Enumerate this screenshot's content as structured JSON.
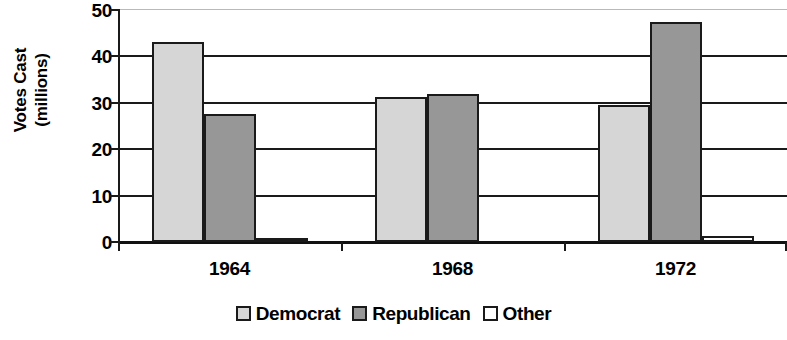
{
  "chart_data": {
    "type": "bar",
    "title": "",
    "xlabel": "",
    "ylabel": "Votes Cast (millions)",
    "ylabel_lines": [
      "Votes Cast",
      "(millions)"
    ],
    "categories": [
      "1964",
      "1968",
      "1972"
    ],
    "series": [
      {
        "name": "Democrat",
        "color": "#d6d6d6",
        "values": [
          43.1,
          31.3,
          29.5
        ]
      },
      {
        "name": "Republican",
        "color": "#979797",
        "values": [
          27.5,
          31.8,
          47.4
        ]
      },
      {
        "name": "Other",
        "color": "#ffffff",
        "values": [
          0.4,
          0.0,
          1.2
        ]
      }
    ],
    "ylim": [
      0,
      50
    ],
    "yticks": [
      0,
      10,
      20,
      30,
      40,
      50
    ],
    "ytick_labels": [
      "0",
      "10",
      "20",
      "30",
      "40",
      "50"
    ],
    "grid": true,
    "grid_axis": "y",
    "legend_position": "bottom",
    "legend": [
      "Democrat",
      "Republican",
      "Other"
    ],
    "bar_outline_color": "#1a1a1a",
    "background_color": "#ffffff"
  }
}
